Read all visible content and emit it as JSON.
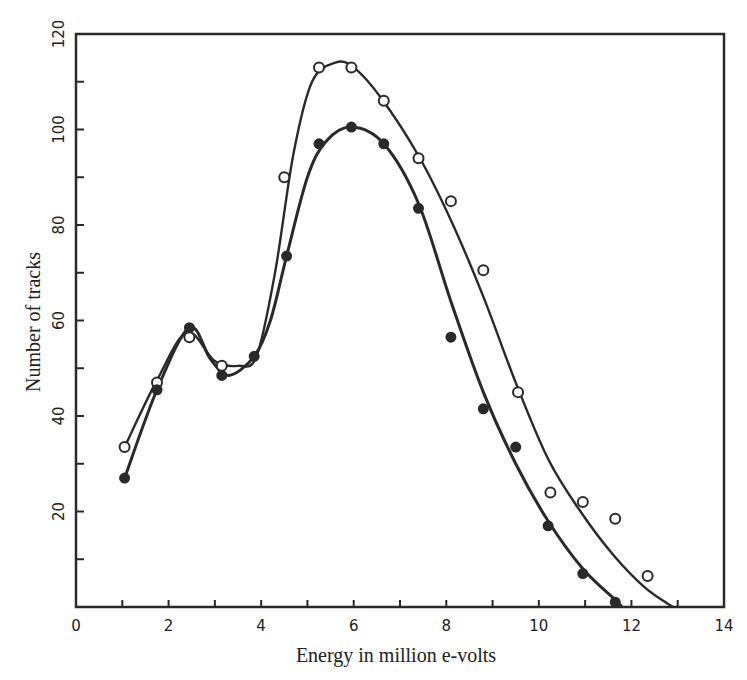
{
  "chart_data": {
    "type": "scatter",
    "title": "",
    "xlabel": "Energy in million e-volts",
    "ylabel": "Number of tracks",
    "xlim": [
      0,
      14
    ],
    "ylim": [
      0,
      120
    ],
    "x_ticks": [
      0,
      2,
      4,
      6,
      8,
      10,
      12,
      14
    ],
    "x_minor_ticks": [
      1,
      3,
      5,
      7,
      9,
      11,
      13
    ],
    "y_ticks": [
      20,
      40,
      60,
      80,
      100,
      120
    ],
    "y_minor_ticks": [
      10,
      30,
      50,
      70,
      90,
      110
    ],
    "grid": false,
    "legend": null,
    "series": [
      {
        "name": "open circles",
        "marker": "open-circle",
        "points": [
          [
            1.05,
            33.5
          ],
          [
            1.75,
            47
          ],
          [
            2.45,
            56.5
          ],
          [
            3.15,
            50.5
          ],
          [
            4.5,
            90
          ],
          [
            5.25,
            113
          ],
          [
            5.95,
            113
          ],
          [
            6.65,
            106
          ],
          [
            7.4,
            94
          ],
          [
            8.1,
            85
          ],
          [
            8.8,
            70.5
          ],
          [
            9.55,
            45
          ],
          [
            10.25,
            24
          ],
          [
            10.95,
            22
          ],
          [
            11.65,
            18.5
          ],
          [
            12.35,
            6.5
          ]
        ],
        "curve": [
          [
            1.05,
            33.5
          ],
          [
            1.75,
            47.5
          ],
          [
            2.4,
            57.5
          ],
          [
            3.0,
            51.5
          ],
          [
            3.5,
            50.5
          ],
          [
            3.9,
            52.5
          ],
          [
            4.3,
            70
          ],
          [
            4.7,
            95
          ],
          [
            5.1,
            110
          ],
          [
            5.6,
            114
          ],
          [
            6.0,
            113
          ],
          [
            6.6,
            106.5
          ],
          [
            7.4,
            94.5
          ],
          [
            8.1,
            81
          ],
          [
            8.8,
            65
          ],
          [
            9.5,
            47
          ],
          [
            10.2,
            31
          ],
          [
            10.9,
            20
          ],
          [
            11.6,
            11
          ],
          [
            12.3,
            4
          ],
          [
            12.9,
            0
          ]
        ]
      },
      {
        "name": "filled circles",
        "marker": "filled-circle",
        "points": [
          [
            1.05,
            27
          ],
          [
            1.75,
            45.5
          ],
          [
            2.45,
            58.5
          ],
          [
            3.15,
            48.5
          ],
          [
            3.85,
            52.5
          ],
          [
            4.55,
            73.5
          ],
          [
            5.25,
            97
          ],
          [
            5.95,
            100.5
          ],
          [
            6.65,
            97
          ],
          [
            7.4,
            83.5
          ],
          [
            8.1,
            56.5
          ],
          [
            8.8,
            41.5
          ],
          [
            9.5,
            33.5
          ],
          [
            10.2,
            17
          ],
          [
            10.95,
            7
          ],
          [
            11.65,
            1
          ]
        ],
        "curve": [
          [
            1.05,
            27
          ],
          [
            1.75,
            45.5
          ],
          [
            2.45,
            58.5
          ],
          [
            2.9,
            52
          ],
          [
            3.3,
            48.5
          ],
          [
            3.85,
            52.5
          ],
          [
            4.2,
            60
          ],
          [
            4.55,
            73.5
          ],
          [
            5.0,
            90
          ],
          [
            5.4,
            97.5
          ],
          [
            5.95,
            100.5
          ],
          [
            6.65,
            97
          ],
          [
            7.4,
            84.5
          ],
          [
            8.1,
            64
          ],
          [
            8.8,
            45
          ],
          [
            9.5,
            30
          ],
          [
            10.2,
            18
          ],
          [
            10.95,
            8
          ],
          [
            11.65,
            1.5
          ],
          [
            11.8,
            0
          ]
        ]
      }
    ]
  },
  "axes": {
    "x_title": "Energy in million e-volts",
    "y_title": "Number of tracks"
  },
  "style": {
    "ink": "#2a2a2a",
    "background": "#ffffff"
  }
}
